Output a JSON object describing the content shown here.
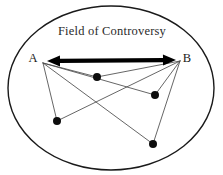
{
  "diagram": {
    "title": "Field of Controversy",
    "title_position": {
      "x": 112,
      "y": 35
    },
    "boundary": {
      "name": "field-boundary-ellipse",
      "cx": 111,
      "cy": 88,
      "rx": 103,
      "ry": 82,
      "stroke": "#1a1a1a",
      "stroke_width": 1.4
    },
    "endpoints": [
      {
        "id": "A",
        "label": "A",
        "label_x": 33,
        "label_y": 62,
        "x": 43,
        "y": 63
      },
      {
        "id": "B",
        "label": "B",
        "label_x": 187,
        "label_y": 62,
        "x": 180,
        "y": 61
      }
    ],
    "axis": {
      "name": "controversy-axis-arrow",
      "x1": 47,
      "y1": 61,
      "x2": 176,
      "y2": 60,
      "stroke": "#000000",
      "stroke_width": 4.2,
      "double_headed": true,
      "head_length": 13,
      "head_width": 11
    },
    "points": [
      {
        "id": "P1",
        "x": 97,
        "y": 77,
        "r": 4.0
      },
      {
        "id": "P2",
        "x": 155,
        "y": 95,
        "r": 4.0
      },
      {
        "id": "P3",
        "x": 57,
        "y": 121,
        "r": 4.0
      },
      {
        "id": "P4",
        "x": 153,
        "y": 144,
        "r": 4.0
      }
    ],
    "connections": [
      {
        "from": "A",
        "to": "P1"
      },
      {
        "from": "A",
        "to": "P2"
      },
      {
        "from": "A",
        "to": "P3"
      },
      {
        "from": "A",
        "to": "P4"
      },
      {
        "from": "B",
        "to": "P1"
      },
      {
        "from": "B",
        "to": "P2"
      },
      {
        "from": "B",
        "to": "P3"
      },
      {
        "from": "B",
        "to": "P4"
      }
    ],
    "line_style": {
      "stroke": "#4a4a4a",
      "stroke_width": 0.85
    },
    "dot_color": "#0d0d0d",
    "background": "#ffffff"
  }
}
